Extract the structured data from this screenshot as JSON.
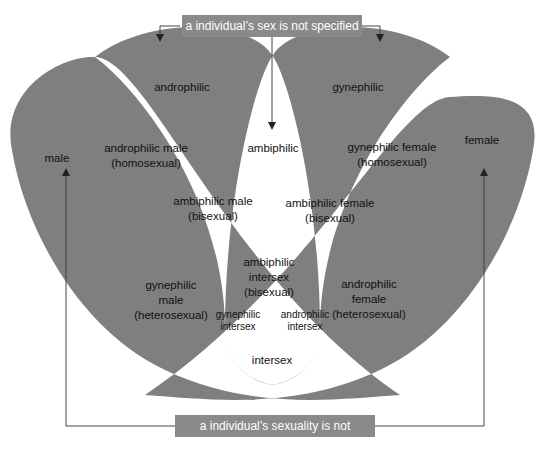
{
  "diagram": {
    "top_box": "a individual’s sex is not specified",
    "bottom_box": "a individual’s sexuality is not specified",
    "colors": {
      "shaded": "#7f7f7f",
      "unshaded": "#ffffff",
      "box": "#8a8a8a",
      "line": "#444444"
    },
    "regions": {
      "androphilic": "androphilic",
      "gynephilic": "gynephilic",
      "male": "male",
      "female": "female",
      "ambiphilic": "ambiphilic",
      "androphilic_male_1": "androphilic male",
      "androphilic_male_2": "(homosexual)",
      "gynephilic_female_1": "gynephilic female",
      "gynephilic_female_2": "(homosexual)",
      "ambiphilic_male_1": "ambiphilic male",
      "ambiphilic_male_2": "(bisexual)",
      "ambiphilic_female_1": "ambiphilic female",
      "ambiphilic_female_2": "(bisexual)",
      "ambiphilic_intersex_1": "ambiphilic",
      "ambiphilic_intersex_2": "intersex",
      "ambiphilic_intersex_3": "(bisexual)",
      "gynephilic_male_1": "gynephilic",
      "gynephilic_male_2": "male",
      "gynephilic_male_3": "(heterosexual)",
      "androphilic_female_1": "androphilic",
      "androphilic_female_2": "female",
      "androphilic_female_3": "(heterosexual)",
      "gynephilic_intersex_1": "gynephilic",
      "gynephilic_intersex_2": "intersex",
      "androphilic_intersex_1": "androphilic",
      "androphilic_intersex_2": "intersex",
      "intersex": "intersex"
    }
  }
}
